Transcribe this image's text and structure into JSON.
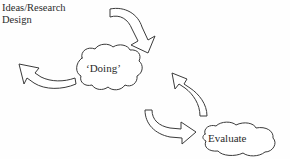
{
  "diagram": {
    "title_caption": "Ideas/Research\nDesign",
    "background_color": "#fefefe",
    "ink_color": "#3a3a3a",
    "style": "hand-drawn sketch",
    "nodes": [
      {
        "id": "doing",
        "label": "‘Doing’",
        "shape": "cloud-blob"
      },
      {
        "id": "evaluate",
        "label": "Evaluate",
        "shape": "cloud-blob"
      }
    ],
    "arrows": [
      {
        "id": "ideas-to-doing",
        "from": "Ideas/Research Design",
        "to": "‘Doing’",
        "direction": "down-right",
        "style": "curved-open-outline"
      },
      {
        "id": "doing-to-out",
        "from": "‘Doing’",
        "to": "outward-left",
        "direction": "up-left",
        "style": "curved-open-outline"
      },
      {
        "id": "evaluate-to-doing",
        "from": "Evaluate",
        "to": "‘Doing’",
        "direction": "up-left",
        "style": "curved-open-outline"
      },
      {
        "id": "doing-to-evaluate",
        "from": "‘Doing’",
        "to": "Evaluate",
        "direction": "down-right",
        "style": "curved-open-outline"
      }
    ]
  }
}
